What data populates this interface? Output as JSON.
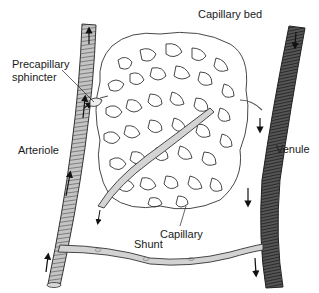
{
  "diagram": {
    "labels": {
      "capillary_bed": "Capillary bed",
      "precapillary_line1": "Precapillary",
      "precapillary_line2": "sphincter",
      "arteriole": "Arteriole",
      "venule": "Venule",
      "capillary": "Capillary",
      "shunt": "Shunt"
    },
    "vessels": [
      {
        "name": "Arteriole",
        "flow": "upward",
        "shade": "light-gray",
        "color": "#bdbdbd"
      },
      {
        "name": "Venule",
        "flow": "downward",
        "shade": "dark-gray",
        "color": "#4a4a4a"
      },
      {
        "name": "Shunt",
        "connects": [
          "Arteriole",
          "Venule"
        ],
        "color": "#cfcfcf"
      },
      {
        "name": "Capillary",
        "flow": "downward",
        "color": "#cfcfcf"
      }
    ],
    "colors": {
      "text": "#1a1a1a",
      "outline": "#333333",
      "arteriole_fill": "#bdbdbd",
      "venule_fill": "#4a4a4a",
      "background": "#ffffff"
    }
  }
}
